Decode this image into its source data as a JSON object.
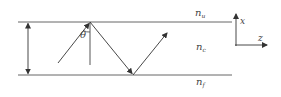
{
  "diagram": {
    "type": "waveguide-ray-diagram",
    "stroke_color": "#555555",
    "label_color": "#444444",
    "regions": [
      {
        "id": "upper",
        "symbol": "n",
        "subscript": "u"
      },
      {
        "id": "core",
        "symbol": "n",
        "subscript": "c"
      },
      {
        "id": "lower",
        "symbol": "n",
        "subscript": "f"
      }
    ],
    "angle_label": "θ",
    "axes": {
      "vertical_label": "x",
      "horizontal_label": "z"
    }
  }
}
